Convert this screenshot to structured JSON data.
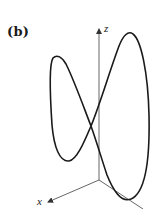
{
  "figure": {
    "panel_label": "(b)",
    "axes": {
      "z_label": "z",
      "x_label": "x"
    },
    "colors": {
      "curve": "#1a1a1a",
      "axes": "#555555",
      "background": "#ffffff"
    }
  }
}
